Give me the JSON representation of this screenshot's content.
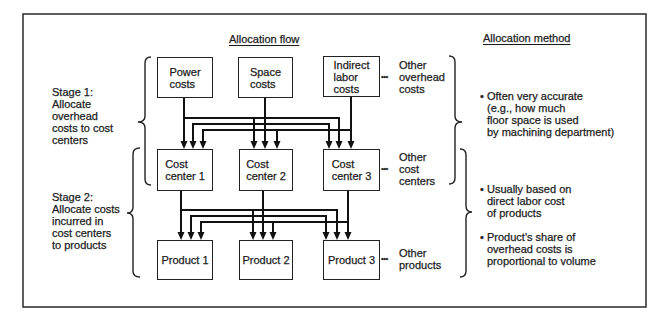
{
  "headers": {
    "flow": "Allocation flow",
    "method": "Allocation method"
  },
  "stages": [
    {
      "lines": [
        "Stage 1:",
        "Allocate",
        "overhead",
        "costs to cost",
        "centers"
      ]
    },
    {
      "lines": [
        "Stage 2:",
        "Allocate costs",
        "incurred in",
        "cost centers",
        "to products"
      ]
    }
  ],
  "overhead_costs": [
    {
      "lines": [
        "Power",
        "costs"
      ]
    },
    {
      "lines": [
        "Space",
        "costs"
      ]
    },
    {
      "lines": [
        "Indirect",
        "labor",
        "costs"
      ]
    }
  ],
  "overhead_other": {
    "lines": [
      "Other",
      "overhead",
      "costs"
    ]
  },
  "cost_centers": [
    {
      "lines": [
        "Cost",
        "center 1"
      ]
    },
    {
      "lines": [
        "Cost",
        "center 2"
      ]
    },
    {
      "lines": [
        "Cost",
        "center 3"
      ]
    }
  ],
  "cost_centers_other": {
    "lines": [
      "Other",
      "cost",
      "centers"
    ]
  },
  "products": [
    {
      "label": "Product 1"
    },
    {
      "label": "Product 2"
    },
    {
      "label": "Product 3"
    }
  ],
  "products_other": {
    "lines": [
      "Other",
      "products"
    ]
  },
  "methods": [
    {
      "lines": [
        "Often very accurate",
        "(e.g., how much",
        "floor space is used",
        "by machining department)"
      ]
    },
    {
      "lines": [
        "Usually based on",
        "direct labor cost",
        "of products"
      ]
    },
    {
      "lines": [
        "Product's share of",
        "overhead costs is",
        "proportional to volume"
      ]
    }
  ],
  "symbols": {
    "ellipsis": "•••",
    "bullet": "•"
  },
  "colors": {
    "line": "#111111",
    "text": "#1c1c1c",
    "background": "#ffffff"
  }
}
